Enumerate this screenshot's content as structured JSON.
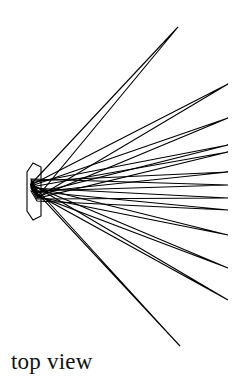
{
  "figure": {
    "title": "top view",
    "caption": "top view",
    "canvas": {
      "width": 246,
      "height": 386
    },
    "colors": {
      "background": "#ffffff",
      "stroke": "#000000",
      "fill": "none",
      "text": "#111111"
    },
    "stroke_width": 1.1,
    "hub": {
      "name": "rotor-hub",
      "points": "33,163 27,172 27,211 33,220 41,216 41,167"
    },
    "apex": {
      "x": 34,
      "y": 191
    },
    "blade_count": 13,
    "blades": [
      {
        "id": 1,
        "label": "blade-1",
        "tip_x": 178,
        "tip_y": 27,
        "points": "31,184 178,27 38,196"
      },
      {
        "id": 2,
        "label": "blade-2",
        "tip_x": 228,
        "tip_y": 84,
        "points": "31,185 228,84 38,197"
      },
      {
        "id": 3,
        "label": "blade-3",
        "tip_x": 228,
        "tip_y": 118,
        "points": "31,186 228,118 38,197"
      },
      {
        "id": 4,
        "label": "blade-4",
        "tip_x": 228,
        "tip_y": 152,
        "points": "31,187 228,152 38,198"
      },
      {
        "id": 5,
        "label": "blade-5",
        "tip_x": 228,
        "tip_y": 172,
        "points": "31,181 228,172 37,192"
      },
      {
        "id": 6,
        "label": "blade-6",
        "tip_x": 228,
        "tip_y": 185,
        "points": "31,179 228,185 37,191"
      },
      {
        "id": 7,
        "label": "blade-7",
        "tip_x": 228,
        "tip_y": 198,
        "points": "31,188 228,198 37,199"
      },
      {
        "id": 8,
        "label": "blade-8",
        "tip_x": 228,
        "tip_y": 210,
        "points": "31,191 228,210 37,201"
      },
      {
        "id": 9,
        "label": "blade-9",
        "tip_x": 228,
        "tip_y": 235,
        "points": "31,186 228,235 38,197"
      },
      {
        "id": 10,
        "label": "blade-10",
        "tip_x": 228,
        "tip_y": 268,
        "points": "31,185 228,268 38,196"
      },
      {
        "id": 11,
        "label": "blade-11",
        "tip_x": 228,
        "tip_y": 300,
        "points": "31,184 228,300 38,195"
      },
      {
        "id": 12,
        "label": "blade-12",
        "tip_x": 180,
        "tip_y": 346,
        "points": "31,183 180,346 38,194"
      },
      {
        "id": 13,
        "label": "blade-13",
        "tip_x": 228,
        "tip_y": 145,
        "points": "31,183 228,145 37,193"
      }
    ]
  }
}
